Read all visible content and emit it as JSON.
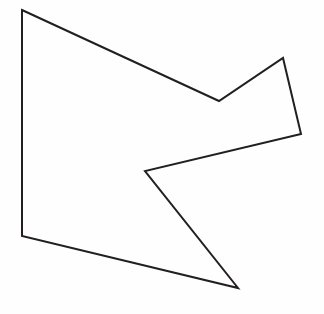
{
  "figure": {
    "background_color": "#fefefe",
    "canvas_width": 324,
    "canvas_height": 314
  },
  "shape": {
    "name": "concave-polygon",
    "type": "polygon",
    "vertex_count": 7,
    "closed": true,
    "stroke_color": "#231f20",
    "fill_color": "none",
    "stroke_width": 2,
    "vertices": [
      {
        "label": "top-left-corner",
        "x": 22,
        "y": 10,
        "kind": "convex"
      },
      {
        "label": "upper-notch-valley",
        "x": 219,
        "y": 101,
        "kind": "concave"
      },
      {
        "label": "upper-right-peak",
        "x": 283,
        "y": 58,
        "kind": "convex"
      },
      {
        "label": "right-corner",
        "x": 301,
        "y": 134,
        "kind": "convex"
      },
      {
        "label": "left-notch-valley",
        "x": 145,
        "y": 171,
        "kind": "concave"
      },
      {
        "label": "bottom-spike-tip",
        "x": 238,
        "y": 288,
        "kind": "convex"
      },
      {
        "label": "bottom-left-corner",
        "x": 22,
        "y": 236,
        "kind": "convex"
      }
    ],
    "points_attr": "22,10 219,101 283,58 301,134 145,171 238,288 22,236",
    "edges": [
      {
        "label": "top-edge",
        "from": "top-left-corner",
        "to": "upper-notch-valley"
      },
      {
        "label": "notch-right-edge",
        "from": "upper-notch-valley",
        "to": "upper-right-peak"
      },
      {
        "label": "upper-right-edge",
        "from": "upper-right-peak",
        "to": "right-corner"
      },
      {
        "label": "inner-upper-edge",
        "from": "right-corner",
        "to": "left-notch-valley"
      },
      {
        "label": "inner-lower-edge",
        "from": "left-notch-valley",
        "to": "bottom-spike-tip"
      },
      {
        "label": "bottom-edge",
        "from": "bottom-spike-tip",
        "to": "bottom-left-corner"
      },
      {
        "label": "left-edge",
        "from": "bottom-left-corner",
        "to": "top-left-corner"
      }
    ]
  }
}
